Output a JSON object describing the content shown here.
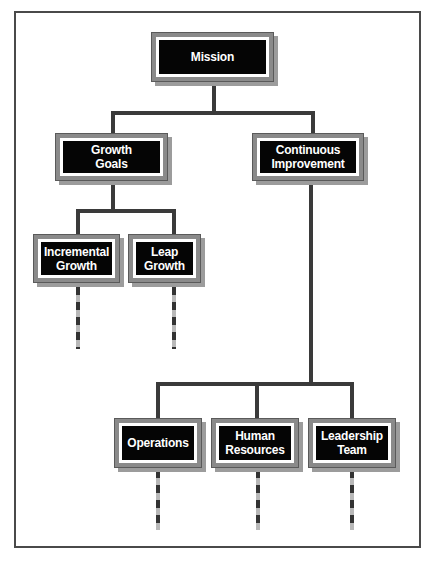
{
  "diagram": {
    "type": "org-chart",
    "nodes": {
      "mission": "Mission",
      "growth_goals": "Growth\nGoals",
      "continuous_improvement": "Continuous\nImprovement",
      "incremental_growth": "Incremental\nGrowth",
      "leap_growth": "Leap\nGrowth",
      "operations": "Operations",
      "human_resources": "Human\nResources",
      "leadership_team": "Leadership\nTeam"
    },
    "edges": [
      [
        "Mission",
        "Growth Goals"
      ],
      [
        "Mission",
        "Continuous Improvement"
      ],
      [
        "Growth Goals",
        "Incremental Growth"
      ],
      [
        "Growth Goals",
        "Leap Growth"
      ],
      [
        "Continuous Improvement",
        "Operations"
      ],
      [
        "Continuous Improvement",
        "Human Resources"
      ],
      [
        "Continuous Improvement",
        "Leadership Team"
      ]
    ],
    "colors": {
      "box_fill": "#050505",
      "box_text": "#ffffff",
      "box_border": "#8a8a8a",
      "connector": "#3a3a3a",
      "dash_light": "#b8b8b8"
    }
  }
}
